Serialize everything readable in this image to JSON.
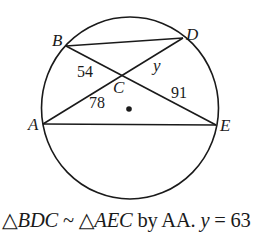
{
  "diagram": {
    "type": "circle-chords",
    "stroke_color": "#1a1a1a",
    "points": {
      "A": {
        "label": "A",
        "x": 43,
        "y": 124
      },
      "B": {
        "label": "B",
        "x": 66,
        "y": 46
      },
      "C": {
        "label": "C",
        "x": 122,
        "y": 75
      },
      "D": {
        "label": "D",
        "x": 183,
        "y": 38
      },
      "E": {
        "label": "E",
        "x": 216,
        "y": 125
      }
    },
    "segments": [
      {
        "from": "B",
        "to": "D"
      },
      {
        "from": "B",
        "to": "E"
      },
      {
        "from": "A",
        "to": "D"
      },
      {
        "from": "A",
        "to": "E"
      }
    ],
    "segment_labels": {
      "BC": "54",
      "CD": "y",
      "AC": "78",
      "CE": "91"
    },
    "center_dot": {
      "x": 129,
      "y": 109
    }
  },
  "caption": {
    "triangle_symbol": "△",
    "triangle1": "BDC",
    "similar_symbol": "~",
    "triangle2": "AEC",
    "reason": "by AA.",
    "variable": "y",
    "equals": "=",
    "value": "63"
  }
}
